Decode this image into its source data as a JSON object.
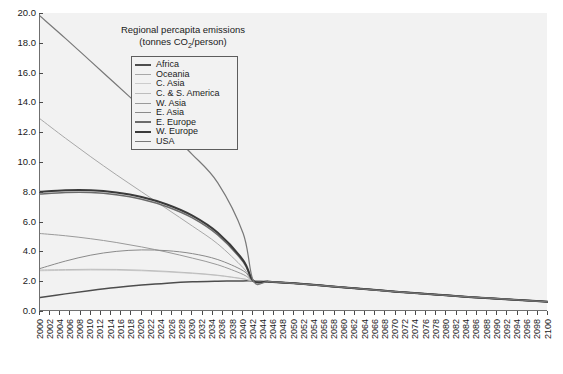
{
  "chart_data": {
    "type": "line",
    "title": "Regional percapita emissions",
    "subtitle": "(tonnes CO2/person)",
    "xlabel": "",
    "ylabel": "",
    "xlim": [
      2000,
      2100
    ],
    "ylim": [
      0.0,
      20.0
    ],
    "grid": false,
    "legend_position": "top-center",
    "y_ticks": [
      "0.0",
      "2.0",
      "4.0",
      "6.0",
      "8.0",
      "10.0",
      "12.0",
      "14.0",
      "16.0",
      "18.0",
      "20.0"
    ],
    "x_ticks": [
      "2000",
      "2002",
      "2004",
      "2006",
      "2008",
      "2010",
      "2012",
      "2014",
      "2016",
      "2018",
      "2020",
      "2022",
      "2024",
      "2026",
      "2028",
      "2030",
      "2032",
      "2034",
      "2036",
      "2038",
      "2040",
      "2042",
      "2044",
      "2046",
      "2048",
      "2050",
      "2052",
      "2054",
      "2056",
      "2058",
      "2060",
      "2062",
      "2064",
      "2066",
      "2068",
      "2070",
      "2072",
      "2074",
      "2076",
      "2078",
      "2080",
      "2082",
      "2084",
      "2086",
      "2088",
      "2090",
      "2092",
      "2094",
      "2096",
      "2098",
      "2100"
    ],
    "x": [
      2000,
      2005,
      2010,
      2015,
      2020,
      2025,
      2030,
      2035,
      2040,
      2042,
      2045,
      2050,
      2055,
      2060,
      2065,
      2070,
      2075,
      2080,
      2085,
      2090,
      2095,
      2100
    ],
    "series": [
      {
        "name": "Africa",
        "color": "#4d4d4d",
        "width": 1.5,
        "values": [
          0.9,
          1.15,
          1.38,
          1.58,
          1.74,
          1.87,
          1.96,
          2.0,
          2.02,
          2.02,
          1.97,
          1.86,
          1.72,
          1.58,
          1.44,
          1.3,
          1.17,
          1.05,
          0.93,
          0.83,
          0.72,
          0.62
        ]
      },
      {
        "name": "Oceania",
        "color": "#a8a8a8",
        "width": 1.0,
        "values": [
          12.9,
          11.6,
          10.35,
          9.15,
          8.0,
          6.85,
          5.7,
          4.5,
          2.9,
          2.02,
          1.97,
          1.86,
          1.72,
          1.58,
          1.44,
          1.3,
          1.17,
          1.05,
          0.93,
          0.83,
          0.72,
          0.62
        ]
      },
      {
        "name": "C. Asia",
        "color": "#cccccc",
        "width": 1.0,
        "values": [
          2.7,
          2.73,
          2.75,
          2.74,
          2.7,
          2.62,
          2.52,
          2.38,
          2.15,
          2.02,
          1.97,
          1.86,
          1.72,
          1.58,
          1.44,
          1.3,
          1.17,
          1.05,
          0.93,
          0.83,
          0.72,
          0.62
        ]
      },
      {
        "name": "C. & S. America",
        "color": "#bdbdbd",
        "width": 1.0,
        "values": [
          2.75,
          2.78,
          2.8,
          2.79,
          2.74,
          2.66,
          2.55,
          2.4,
          2.16,
          2.02,
          1.97,
          1.86,
          1.72,
          1.58,
          1.44,
          1.3,
          1.17,
          1.05,
          0.93,
          0.83,
          0.72,
          0.62
        ]
      },
      {
        "name": "W. Asia",
        "color": "#9a9a9a",
        "width": 1.0,
        "values": [
          5.2,
          5.05,
          4.85,
          4.6,
          4.3,
          3.95,
          3.55,
          3.1,
          2.45,
          2.02,
          1.97,
          1.86,
          1.72,
          1.58,
          1.44,
          1.3,
          1.17,
          1.05,
          0.93,
          0.83,
          0.72,
          0.62
        ]
      },
      {
        "name": "E. Asia",
        "color": "#8a8a8a",
        "width": 1.0,
        "values": [
          2.85,
          3.35,
          3.75,
          4.0,
          4.1,
          4.05,
          3.85,
          3.45,
          2.7,
          2.02,
          1.97,
          1.86,
          1.72,
          1.58,
          1.44,
          1.3,
          1.17,
          1.05,
          0.93,
          0.83,
          0.72,
          0.62
        ]
      },
      {
        "name": "E. Europe",
        "color": "#6b6b6b",
        "width": 1.6,
        "values": [
          7.85,
          7.95,
          7.95,
          7.8,
          7.5,
          7.0,
          6.25,
          5.1,
          3.3,
          2.02,
          1.97,
          1.86,
          1.72,
          1.58,
          1.44,
          1.3,
          1.17,
          1.05,
          0.93,
          0.83,
          0.72,
          0.62
        ]
      },
      {
        "name": "W. Europe",
        "color": "#3a3a3a",
        "width": 2.0,
        "values": [
          8.0,
          8.1,
          8.1,
          7.95,
          7.65,
          7.15,
          6.4,
          5.25,
          3.4,
          2.02,
          1.97,
          1.86,
          1.72,
          1.58,
          1.44,
          1.3,
          1.17,
          1.05,
          0.93,
          0.83,
          0.72,
          0.62
        ]
      },
      {
        "name": "USA",
        "color": "#787878",
        "width": 1.2,
        "values": [
          19.8,
          18.3,
          16.75,
          15.2,
          13.65,
          12.1,
          10.5,
          8.6,
          5.2,
          2.02,
          1.97,
          1.86,
          1.72,
          1.58,
          1.44,
          1.3,
          1.17,
          1.05,
          0.93,
          0.83,
          0.72,
          0.62
        ]
      }
    ]
  },
  "legend": {
    "items": [
      {
        "label": "Africa"
      },
      {
        "label": "Oceania"
      },
      {
        "label": "C. Asia"
      },
      {
        "label": "C. & S. America"
      },
      {
        "label": "W. Asia"
      },
      {
        "label": "E. Asia"
      },
      {
        "label": "E. Europe"
      },
      {
        "label": "W. Europe"
      },
      {
        "label": "USA"
      }
    ]
  }
}
